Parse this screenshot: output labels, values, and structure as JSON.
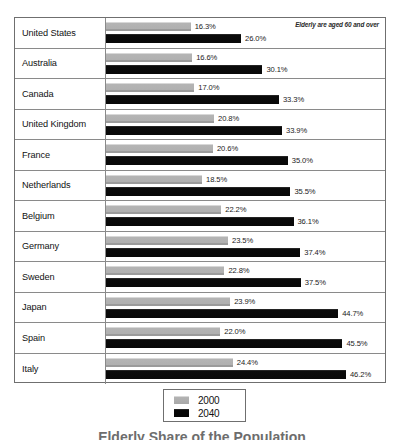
{
  "chart_data": {
    "type": "bar",
    "orientation": "horizontal",
    "title": "Elderly Share of the Population",
    "note": "Elderly are aged 60 and over",
    "xlabel": "",
    "ylabel": "",
    "xlim": [
      0,
      46.2
    ],
    "grid": false,
    "legend_position": "bottom-center",
    "value_suffix": "%",
    "categories": [
      "United States",
      "Australia",
      "Canada",
      "United Kingdom",
      "France",
      "Netherlands",
      "Belgium",
      "Germany",
      "Sweden",
      "Japan",
      "Spain",
      "Italy"
    ],
    "series": [
      {
        "name": "2000",
        "color": "#b2b2b2",
        "values": [
          16.3,
          16.6,
          17.0,
          20.8,
          20.6,
          18.5,
          22.2,
          23.5,
          22.8,
          23.9,
          22.0,
          24.4
        ],
        "labels": [
          "16.3%",
          "16.6%",
          "17.0%",
          "20.8%",
          "20.6%",
          "18.5%",
          "22.2%",
          "23.5%",
          "22.8%",
          "23.9%",
          "22.0%",
          "24.4%"
        ]
      },
      {
        "name": "2040",
        "color": "#080808",
        "values": [
          26.0,
          30.1,
          33.3,
          33.9,
          35.0,
          35.5,
          36.1,
          37.4,
          37.5,
          44.7,
          45.5,
          46.2
        ],
        "labels": [
          "26.0%",
          "30.1%",
          "33.3%",
          "33.9%",
          "35.0%",
          "35.5%",
          "36.1%",
          "37.4%",
          "37.5%",
          "44.7%",
          "45.5%",
          "46.2%"
        ]
      }
    ]
  },
  "legend": {
    "items": [
      {
        "label": "2000"
      },
      {
        "label": "2040"
      }
    ]
  }
}
